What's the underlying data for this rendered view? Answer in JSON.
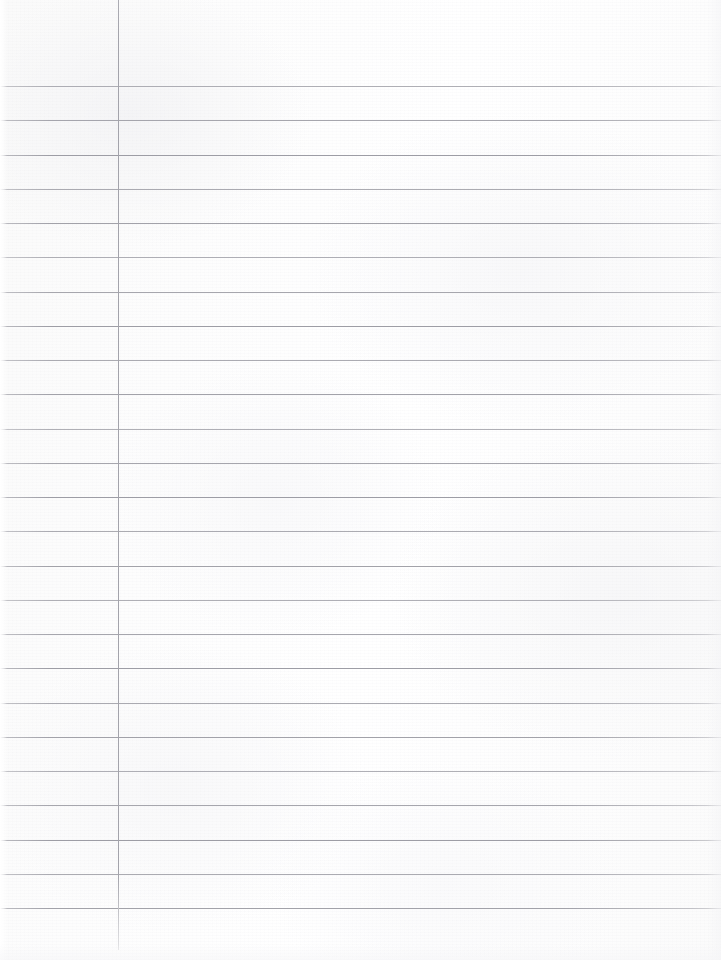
{
  "document": {
    "kind": "ruled-notebook-paper",
    "title": "Blank Ruled Notebook Page",
    "page_width": 721,
    "page_height": 960,
    "written_content": "",
    "paper_color": "#fcfcfc",
    "rule_color": "#9c9ca4",
    "margin_line_color": "#a3a3ab"
  },
  "ruling": {
    "line_count": 25,
    "first_line_y": 86,
    "line_spacing": 34.3,
    "line_thickness": 1,
    "line_left_x": 0,
    "line_right_x": 721,
    "lines_y": [
      86,
      120,
      155,
      189,
      223,
      257,
      292,
      326,
      360,
      394,
      429,
      463,
      497,
      531,
      566,
      600,
      634,
      668,
      703,
      737,
      771,
      805,
      840,
      874,
      908
    ]
  },
  "margin": {
    "label": "left-margin-rule",
    "x": 118,
    "top_y": 0,
    "bottom_y": 950,
    "thickness": 1
  }
}
